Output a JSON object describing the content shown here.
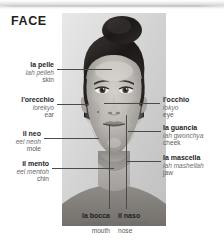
{
  "page": {
    "title": "FACE",
    "background_color": "#ffffff",
    "text_color": "#2b2b2b",
    "phonetic_color": "#6d6d6d",
    "leader_line_color": "#4a4a4a"
  },
  "photo": {
    "alt": "grayscale portrait photograph of a woman facing forward with hair pulled back in a bun"
  },
  "labels": {
    "pelle": {
      "italian": "la pelle",
      "phonetic": "lah pelleh",
      "english": "skin"
    },
    "orecchio": {
      "italian": "l'orecchio",
      "phonetic": "lorekyo",
      "english": "ear"
    },
    "neo": {
      "italian": "il neo",
      "phonetic": "eel neoh",
      "english": "mole"
    },
    "mento": {
      "italian": "il mento",
      "phonetic": "eel mentoh",
      "english": "chin"
    },
    "occhio": {
      "italian": "l'occhio",
      "phonetic": "lokyo",
      "english": "eye"
    },
    "guancia": {
      "italian": "la guancia",
      "phonetic": "lah gwonchya",
      "english": "cheek"
    },
    "mascella": {
      "italian": "la mascella",
      "phonetic": "lah mashellah",
      "english": "jaw"
    },
    "bocca": {
      "italian": "la bocca",
      "phonetic": "lah bokah",
      "english": "mouth"
    },
    "naso": {
      "italian": "il naso",
      "phonetic": "eel nazoh",
      "english": "nose"
    }
  }
}
